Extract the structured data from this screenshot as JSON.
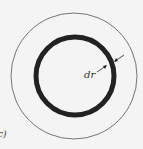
{
  "figure": {
    "panel_label": "c)",
    "annotation": "dr",
    "colors": {
      "background": "#f4f4f4",
      "outer_circle": "#555555",
      "inner_ring": "#222222"
    }
  }
}
